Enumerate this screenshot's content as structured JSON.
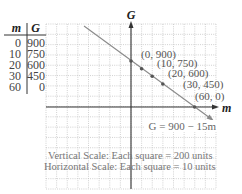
{
  "table": {
    "headers": [
      "m",
      "G"
    ],
    "rows": [
      [
        "0",
        "900"
      ],
      [
        "10",
        "750"
      ],
      [
        "20",
        "600"
      ],
      [
        "30",
        "450"
      ],
      [
        "60",
        "0"
      ]
    ]
  },
  "axes": {
    "x_label": "m",
    "y_label": "G"
  },
  "points": [
    {
      "label": "(0, 900)"
    },
    {
      "label": "(10, 750)"
    },
    {
      "label": "(20, 600)"
    },
    {
      "label": "(30, 450)"
    },
    {
      "label": "(60, 0)"
    }
  ],
  "equation": "G = 900 − 15m",
  "scale": {
    "vertical": "Vertical Scale: Each square = 200 units",
    "horizontal": "Horizontal Scale: Each square = 10 units"
  },
  "colors": {
    "line": "#888888",
    "axis": "#333333",
    "grid": "#bbbbbb",
    "point": "#555555"
  },
  "chart_data": {
    "type": "line",
    "title": "",
    "xlabel": "m",
    "ylabel": "G",
    "x": [
      0,
      10,
      20,
      30,
      60
    ],
    "values": [
      900,
      750,
      600,
      450,
      0
    ],
    "series": [
      {
        "name": "G = 900 − 15m",
        "x": [
          0,
          10,
          20,
          30,
          60
        ],
        "values": [
          900,
          750,
          600,
          450,
          0
        ]
      }
    ],
    "table": {
      "columns": [
        "m",
        "G"
      ],
      "rows": [
        [
          0,
          900
        ],
        [
          10,
          750
        ],
        [
          20,
          600
        ],
        [
          30,
          450
        ],
        [
          60,
          0
        ]
      ]
    },
    "annotations": [
      "(0, 900)",
      "(10, 750)",
      "(20, 600)",
      "(30, 450)",
      "(60, 0)",
      "G = 900 − 15m"
    ],
    "xlim": [
      -80,
      80
    ],
    "ylim": [
      -1600,
      1600
    ],
    "x_grid_step": 10,
    "y_grid_step": 200,
    "grid": true,
    "legend": "none",
    "notes": [
      "Vertical Scale: Each square = 200 units",
      "Horizontal Scale: Each square = 10 units"
    ]
  }
}
